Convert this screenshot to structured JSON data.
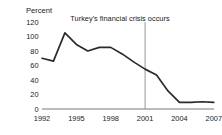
{
  "chart_data": {
    "type": "line",
    "title": "",
    "subtitle": "",
    "xlabel": "",
    "ylabel": "Percent",
    "ylabel_position": "top-left",
    "x": [
      1992,
      1993,
      1994,
      1995,
      1996,
      1997,
      1998,
      1999,
      2000,
      2001,
      2002,
      2003,
      2004,
      2005,
      2006,
      2007
    ],
    "values": [
      70,
      66,
      105,
      89,
      80,
      85,
      85,
      76,
      65,
      55,
      47,
      25,
      9,
      9,
      10,
      9
    ],
    "series": [
      {
        "name": "Percent",
        "values": [
          70,
          66,
          105,
          89,
          80,
          85,
          85,
          76,
          65,
          55,
          47,
          25,
          9,
          9,
          10,
          9
        ]
      }
    ],
    "xlim": [
      1992,
      2007
    ],
    "ylim": [
      0,
      120
    ],
    "ytick_values": [
      0,
      20,
      40,
      60,
      80,
      100,
      120
    ],
    "ytick_labels": [
      "0",
      "20",
      "40",
      "60",
      "80",
      "100",
      "120"
    ],
    "xtick_values": [
      1992,
      1995,
      1998,
      2001,
      2004,
      2007
    ],
    "xtick_labels": [
      "1992",
      "1995",
      "1998",
      "2001",
      "2004",
      "2007"
    ],
    "grid": false,
    "legend": false,
    "legend_position": "none",
    "line_color": "#2b2b2b",
    "annotations": [
      {
        "text": "Turkey's financial crisis occurs",
        "x": 2001,
        "type": "vertical-line-label",
        "line_color": "#8d8d8d"
      }
    ]
  }
}
